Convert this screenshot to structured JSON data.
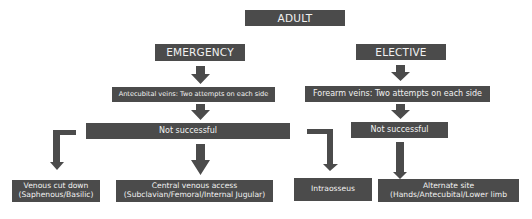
{
  "diagram": {
    "root": "ADULT",
    "branches": {
      "emergency": {
        "label": "EMERGENCY",
        "step1": "Antecubital veins: Two attempts on each side",
        "fail": "Not successful",
        "outcomes": [
          {
            "line1": "Venous cut down",
            "line2": "(Saphenous/Basilic)"
          },
          {
            "line1": "Central venous access",
            "line2": "(Subclavian/Femoral/Internal Jugular)"
          },
          {
            "line1": "Intraosseus",
            "line2": ""
          }
        ]
      },
      "elective": {
        "label": "ELECTIVE",
        "step1": "Forearm veins: Two attempts on each side",
        "fail": "Not successful",
        "outcome": {
          "line1": "Alternate site",
          "line2": "(Hands/Antecubital/Lower limb"
        }
      }
    },
    "colors": {
      "box": "#4b4b4b",
      "text": "#f2f2f2",
      "arrow": "#4b4b4b",
      "background": "#ffffff"
    }
  }
}
